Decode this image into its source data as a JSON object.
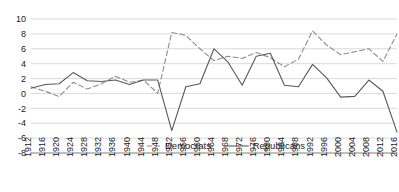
{
  "chart_data": {
    "type": "line",
    "title": "",
    "subtitle": "",
    "xlabel": "",
    "ylabel": "",
    "xlim": [
      1912,
      2016
    ],
    "ylim": [
      -8,
      10
    ],
    "ytick_step": 2,
    "grid": true,
    "grid_axis": "y",
    "legend_position": "bottom",
    "x": [
      1912,
      1916,
      1920,
      1924,
      1928,
      1932,
      1936,
      1940,
      1944,
      1948,
      1952,
      1956,
      1960,
      1964,
      1968,
      1972,
      1976,
      1980,
      1984,
      1988,
      1992,
      1996,
      2000,
      2004,
      2008,
      2012,
      2016
    ],
    "categories": [
      "1912",
      "1916",
      "1920",
      "1924",
      "1928",
      "1932",
      "1936",
      "1940",
      "1944",
      "1948",
      "1952",
      "1956",
      "1960",
      "1964",
      "1968",
      "1972",
      "1976",
      "1980",
      "1984",
      "1988",
      "1992",
      "1996",
      "2000",
      "2004",
      "2008",
      "2012",
      "2016"
    ],
    "yticks": [
      10,
      8,
      6,
      4,
      2,
      0,
      -2,
      -4,
      -6,
      -8
    ],
    "ytick_labels": [
      "10",
      "8",
      "6",
      "4",
      "2",
      "0",
      "-2",
      "-4",
      "-6",
      "-8"
    ],
    "series": [
      {
        "name": "Democrats",
        "style": "dashed",
        "color": "#8c8c8c",
        "values": [
          0.9,
          0.3,
          -0.4,
          1.5,
          0.6,
          1.3,
          2.3,
          1.5,
          1.8,
          0.0,
          8.2,
          7.8,
          6.0,
          4.4,
          5.0,
          4.7,
          5.5,
          4.8,
          3.6,
          4.6,
          8.4,
          6.5,
          5.2,
          5.6,
          6.0,
          4.3,
          8.0
        ]
      },
      {
        "name": "Republicans",
        "style": "solid",
        "color": "#595959",
        "values": [
          0.7,
          1.2,
          1.3,
          2.8,
          1.7,
          1.6,
          1.8,
          1.2,
          1.8,
          1.8,
          -5.0,
          0.9,
          1.3,
          6.0,
          4.2,
          1.1,
          5.0,
          5.4,
          1.1,
          0.9,
          3.9,
          2.1,
          -0.5,
          -0.4,
          1.8,
          0.3,
          -5.2
        ]
      }
    ]
  },
  "legend": {
    "items": [
      {
        "label": "Democrats",
        "style": "dashed"
      },
      {
        "label": "Republicans",
        "style": "solid"
      }
    ]
  }
}
